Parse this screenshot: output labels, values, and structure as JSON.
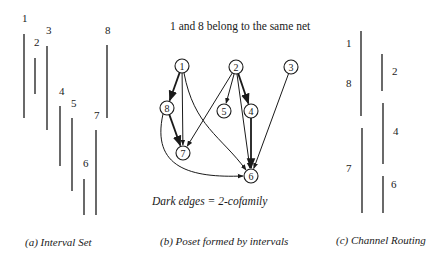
{
  "panel_a": {
    "caption": "(a) Interval Set",
    "intervals": [
      {
        "label": "1",
        "x": 24,
        "y1": 34,
        "y2": 118,
        "lx": 22,
        "ly": 13
      },
      {
        "label": "2",
        "x": 35,
        "y1": 58,
        "y2": 94,
        "lx": 34,
        "ly": 37
      },
      {
        "label": "3",
        "x": 47,
        "y1": 46,
        "y2": 130,
        "lx": 46,
        "ly": 25
      },
      {
        "label": "4",
        "x": 60,
        "y1": 106,
        "y2": 166,
        "lx": 59,
        "ly": 86
      },
      {
        "label": "5",
        "x": 72,
        "y1": 118,
        "y2": 191,
        "lx": 71,
        "ly": 98
      },
      {
        "label": "6",
        "x": 84,
        "y1": 179,
        "y2": 215,
        "lx": 83,
        "ly": 158
      },
      {
        "label": "7",
        "x": 96,
        "y1": 130,
        "y2": 215,
        "lx": 94,
        "ly": 110
      },
      {
        "label": "8",
        "x": 107,
        "y1": 45,
        "y2": 118,
        "lx": 105,
        "ly": 25
      }
    ]
  },
  "panel_b": {
    "title": "1 and 8 belong to the same net",
    "note": "Dark edges = 2-cofamily",
    "caption": "(b) Poset formed by intervals",
    "nodes": [
      {
        "id": "1",
        "x": 182,
        "y": 66
      },
      {
        "id": "2",
        "x": 236,
        "y": 67
      },
      {
        "id": "3",
        "x": 291,
        "y": 67
      },
      {
        "id": "8",
        "x": 167,
        "y": 108
      },
      {
        "id": "5",
        "x": 224,
        "y": 111
      },
      {
        "id": "4",
        "x": 251,
        "y": 111
      },
      {
        "id": "7",
        "x": 183,
        "y": 153
      },
      {
        "id": "6",
        "x": 251,
        "y": 176
      }
    ],
    "edges": [
      {
        "from": "1",
        "to": "8",
        "dark": true
      },
      {
        "from": "1",
        "to": "7",
        "dark": false
      },
      {
        "from": "1",
        "to": "6",
        "dark": false
      },
      {
        "from": "8",
        "to": "7",
        "dark": true
      },
      {
        "from": "8",
        "to": "6",
        "dark": false
      },
      {
        "from": "2",
        "to": "7",
        "dark": false
      },
      {
        "from": "2",
        "to": "5",
        "dark": false
      },
      {
        "from": "2",
        "to": "4",
        "dark": true
      },
      {
        "from": "2",
        "to": "6",
        "dark": false
      },
      {
        "from": "4",
        "to": "6",
        "dark": true
      },
      {
        "from": "3",
        "to": "6",
        "dark": false
      }
    ]
  },
  "panel_c": {
    "caption": "(c) Channel Routing",
    "tracks": [
      {
        "labels": [
          "1",
          "8"
        ],
        "x": 361,
        "y1": 31,
        "y2": 116
      },
      {
        "labels": [
          "7"
        ],
        "x": 362,
        "y1": 128,
        "y2": 213
      },
      {
        "labels": [
          "2"
        ],
        "x": 382,
        "y1": 54,
        "y2": 91
      },
      {
        "labels": [
          "4"
        ],
        "x": 383,
        "y1": 103,
        "y2": 164
      },
      {
        "labels": [
          "6"
        ],
        "x": 383,
        "y1": 176,
        "y2": 213
      }
    ],
    "track_labels": [
      {
        "text": "1",
        "x": 346,
        "y": 38
      },
      {
        "text": "8",
        "x": 346,
        "y": 78
      },
      {
        "text": "7",
        "x": 346,
        "y": 163
      },
      {
        "text": "2",
        "x": 392,
        "y": 66
      },
      {
        "text": "4",
        "x": 393,
        "y": 126
      },
      {
        "text": "6",
        "x": 391,
        "y": 179
      }
    ]
  },
  "colors": {
    "ink": "#1a1a1a",
    "background": "#ffffff"
  }
}
